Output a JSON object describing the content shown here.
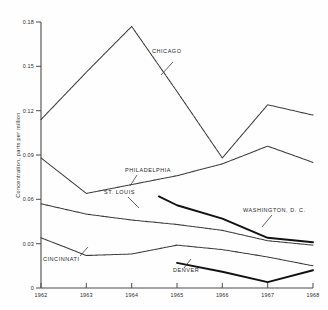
{
  "chart_data": {
    "type": "line",
    "title": "",
    "xlabel": "",
    "ylabel": "Concentration, parts per million",
    "x": [
      1962,
      1963,
      1964,
      1965,
      1966,
      1967,
      1968
    ],
    "xtick_labels": [
      "1962",
      "1963",
      "1964",
      "1965",
      "1966",
      "1967",
      "1968"
    ],
    "ytick_labels": [
      "0",
      "0.03",
      "0.06",
      "0.09",
      "0.12",
      "0.15",
      "0.18"
    ],
    "ytick_values": [
      0,
      0.03,
      0.06,
      0.09,
      0.12,
      0.15,
      0.18
    ],
    "xlim": [
      1962,
      1968
    ],
    "ylim": [
      0,
      0.18
    ],
    "grid": false,
    "legend": "inline-annotations",
    "series": [
      {
        "name": "CHICAGO",
        "style": "thin-dashed",
        "x": [
          1962,
          1963,
          1964,
          1965,
          1966,
          1967,
          1968
        ],
        "values": [
          0.114,
          0.146,
          0.177,
          0.133,
          0.088,
          0.124,
          0.117
        ]
      },
      {
        "name": "PHILADELPHIA",
        "style": "thin-dashed",
        "x": [
          1962,
          1963,
          1964,
          1965,
          1966,
          1967,
          1968
        ],
        "values": [
          0.088,
          0.064,
          0.07,
          0.076,
          0.084,
          0.096,
          0.085
        ]
      },
      {
        "name": "ST. LOUIS",
        "style": "thick-solid",
        "x": [
          1964.6,
          1965,
          1966,
          1967,
          1968
        ],
        "values": [
          0.062,
          0.056,
          0.047,
          0.034,
          0.031
        ]
      },
      {
        "name": "WASHINGTON, D. C.",
        "style": "thin-dashed",
        "x": [
          1962,
          1963,
          1964,
          1965,
          1966,
          1967,
          1968
        ],
        "values": [
          0.057,
          0.05,
          0.046,
          0.043,
          0.039,
          0.032,
          0.029
        ]
      },
      {
        "name": "CINCINNATI",
        "style": "thin-dashed",
        "x": [
          1962,
          1963,
          1964,
          1965,
          1966,
          1967,
          1968
        ],
        "values": [
          0.034,
          0.022,
          0.023,
          0.029,
          0.026,
          0.021,
          0.015
        ]
      },
      {
        "name": "DENVER",
        "style": "thick-solid",
        "x": [
          1965,
          1966,
          1967,
          1968
        ],
        "values": [
          0.017,
          0.011,
          0.004,
          0.012
        ]
      }
    ],
    "annotations": [
      {
        "text": "CHICAGO",
        "x": 152,
        "y": 53
      },
      {
        "text": "PHILADELPHIA",
        "x": 125,
        "y": 172
      },
      {
        "text": "ST. LOUIS",
        "x": 104,
        "y": 194
      },
      {
        "text": "WASHINGTON, D. C.",
        "x": 243,
        "y": 212
      },
      {
        "text": "CINCINNATI",
        "x": 43,
        "y": 261
      },
      {
        "text": "DENVER",
        "x": 173,
        "y": 272
      }
    ]
  }
}
